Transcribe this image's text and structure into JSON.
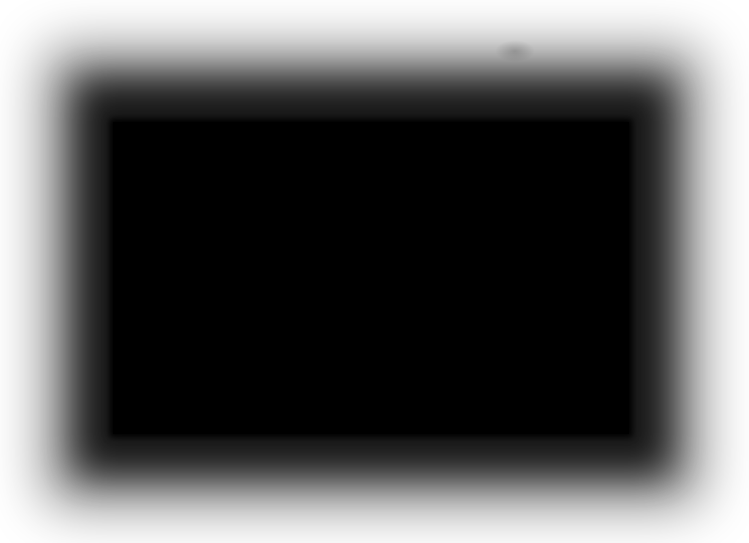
{
  "image": {
    "description": "Black rectangle with soft blurred gradient edges on a white background",
    "colors": {
      "background": "#ffffff",
      "rectangle": "#000000"
    },
    "rectangle": {
      "x": 113,
      "y": 122,
      "width": 516,
      "height": 312
    }
  }
}
